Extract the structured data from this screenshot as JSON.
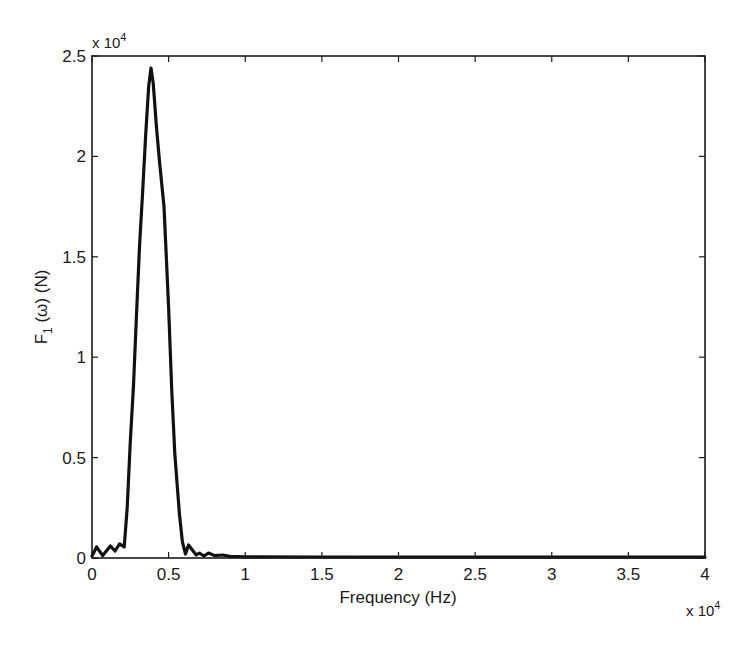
{
  "chart_data": {
    "type": "line",
    "title": "",
    "xlabel": "Frequency (Hz)",
    "ylabel_main": "F",
    "ylabel_sub": "1",
    "ylabel_rest": " (ω) (N)",
    "ylabel": "F1 (ω) (N)",
    "x_multiplier": "x 10",
    "x_multiplier_exp": "4",
    "y_multiplier": "x 10",
    "y_multiplier_exp": "4",
    "xlim": [
      0,
      40000
    ],
    "ylim": [
      0,
      25000
    ],
    "grid": false,
    "legend": null,
    "xticks": [
      0,
      5000,
      10000,
      15000,
      20000,
      25000,
      30000,
      35000,
      40000
    ],
    "xtick_labels": [
      "0",
      "0.5",
      "1",
      "1.5",
      "2",
      "2.5",
      "3",
      "3.5",
      "4"
    ],
    "yticks": [
      0,
      5000,
      10000,
      15000,
      20000,
      25000
    ],
    "ytick_labels": [
      "0",
      "0.5",
      "1",
      "1.5",
      "2",
      "2.5"
    ],
    "series": [
      {
        "name": "F1",
        "color": "#111111",
        "x": [
          0,
          300,
          700,
          1200,
          1500,
          1800,
          2100,
          2300,
          2500,
          2700,
          2900,
          3100,
          3300,
          3500,
          3700,
          3850,
          4000,
          4200,
          4400,
          4700,
          5000,
          5200,
          5400,
          5700,
          5900,
          6100,
          6300,
          6500,
          6800,
          7000,
          7300,
          7600,
          8000,
          8500,
          9000,
          10000,
          15000,
          20000,
          25000,
          30000,
          35000,
          40000
        ],
        "y": [
          100,
          550,
          120,
          600,
          350,
          700,
          550,
          2500,
          5800,
          8500,
          12000,
          15500,
          18200,
          21000,
          23500,
          24400,
          23600,
          21500,
          19800,
          17500,
          12500,
          8400,
          5200,
          2200,
          800,
          200,
          650,
          450,
          150,
          250,
          100,
          250,
          120,
          150,
          80,
          60,
          50,
          40,
          40,
          40,
          40,
          40
        ]
      }
    ]
  }
}
